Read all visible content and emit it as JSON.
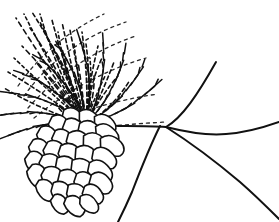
{
  "document": {
    "background_color": "#ffffff",
    "ink_color": "#111111"
  },
  "figure": {
    "caption": "Figure 1-5",
    "caption_cropped_at_top": true,
    "style": "black-and-white-pen-and-ink-line-drawing",
    "width": 279,
    "height": 222
  },
  "art": {
    "branch": {
      "name": "branch-lines",
      "stroke": "#111111",
      "stroke_width": 2.0,
      "node": [
        166,
        126
      ],
      "paths": [
        "M 126 126 C 140 126 154 126 166 127",
        "M 166 127 C 182 118 198 94 216 62",
        "M 166 127 C 186 132 206 136 226 134 C 244 133 262 128 279 122",
        "M 166 127 C 188 141 214 160 240 182 C 256 196 268 208 279 219",
        "M 160 126 C 152 142 142 166 132 192 C 126 206 122 214 118 222"
      ]
    },
    "cone": {
      "name": "pine-cone",
      "stroke": "#111111",
      "stroke_width": 1.6,
      "fill": "#ffffff",
      "axis_angle_deg": 48,
      "scale_count": 34,
      "scales": [
        [
          74,
          118,
          13,
          9,
          42
        ],
        [
          90,
          120,
          13,
          9,
          40
        ],
        [
          105,
          124,
          12,
          9,
          35
        ],
        [
          60,
          126,
          13,
          10,
          48
        ],
        [
          75,
          130,
          14,
          10,
          44
        ],
        [
          91,
          132,
          14,
          10,
          40
        ],
        [
          107,
          134,
          13,
          9,
          34
        ],
        [
          48,
          137,
          13,
          10,
          52
        ],
        [
          64,
          141,
          14,
          10,
          48
        ],
        [
          80,
          143,
          15,
          11,
          43
        ],
        [
          96,
          145,
          15,
          11,
          38
        ],
        [
          112,
          146,
          13,
          10,
          33
        ],
        [
          40,
          150,
          13,
          10,
          55
        ],
        [
          56,
          153,
          14,
          11,
          50
        ],
        [
          72,
          156,
          15,
          11,
          45
        ],
        [
          88,
          158,
          15,
          11,
          40
        ],
        [
          104,
          158,
          14,
          10,
          35
        ],
        [
          36,
          163,
          13,
          10,
          58
        ],
        [
          52,
          166,
          14,
          11,
          52
        ],
        [
          68,
          169,
          15,
          11,
          47
        ],
        [
          84,
          171,
          15,
          11,
          42
        ],
        [
          100,
          171,
          14,
          10,
          36
        ],
        [
          38,
          176,
          13,
          10,
          60
        ],
        [
          54,
          179,
          14,
          11,
          54
        ],
        [
          70,
          182,
          14,
          11,
          48
        ],
        [
          86,
          183,
          14,
          10,
          43
        ],
        [
          101,
          183,
          13,
          10,
          37
        ],
        [
          46,
          190,
          12,
          9,
          58
        ],
        [
          62,
          193,
          13,
          10,
          52
        ],
        [
          78,
          195,
          13,
          10,
          46
        ],
        [
          93,
          194,
          12,
          9,
          40
        ],
        [
          60,
          204,
          11,
          8,
          55
        ],
        [
          75,
          206,
          12,
          9,
          48
        ],
        [
          89,
          204,
          11,
          8,
          42
        ]
      ]
    },
    "needles": {
      "name": "needle-cluster",
      "stroke": "#111111",
      "style": "dashed-stippled-strokes",
      "origin": [
        86,
        124
      ],
      "stroke_width": 1.6,
      "dash_pattern": "4 3",
      "rays": [
        [
          86,
          124,
          16,
          18
        ],
        [
          86,
          124,
          24,
          14
        ],
        [
          86,
          124,
          32,
          12
        ],
        [
          86,
          124,
          40,
          14
        ],
        [
          86,
          124,
          30,
          28
        ],
        [
          86,
          124,
          40,
          22
        ],
        [
          86,
          124,
          52,
          20
        ],
        [
          86,
          124,
          62,
          22
        ],
        [
          86,
          124,
          46,
          36
        ],
        [
          86,
          124,
          58,
          32
        ],
        [
          86,
          124,
          70,
          30
        ],
        [
          86,
          124,
          82,
          32
        ],
        [
          86,
          124,
          62,
          48
        ],
        [
          86,
          124,
          74,
          44
        ],
        [
          86,
          124,
          86,
          44
        ],
        [
          86,
          124,
          98,
          46
        ],
        [
          86,
          124,
          78,
          62
        ],
        [
          86,
          124,
          90,
          58
        ],
        [
          86,
          124,
          102,
          58
        ],
        [
          86,
          124,
          114,
          62
        ],
        [
          86,
          124,
          94,
          76
        ],
        [
          86,
          124,
          106,
          74
        ],
        [
          86,
          124,
          118,
          76
        ],
        [
          86,
          124,
          130,
          80
        ],
        [
          86,
          124,
          36,
          62
        ],
        [
          86,
          124,
          44,
          76
        ],
        [
          86,
          124,
          50,
          90
        ],
        [
          86,
          124,
          56,
          104
        ],
        [
          86,
          124,
          22,
          46
        ],
        [
          86,
          124,
          14,
          58
        ],
        [
          86,
          124,
          8,
          72
        ],
        [
          86,
          124,
          4,
          88
        ]
      ],
      "fan_sweeps": [
        "M 24 96 C 48 62 84 36 126 22",
        "M 28 108 C 56 76 94 50 136 36",
        "M 34 118 C 66 92 104 70 146 58",
        "M 44 126 C 78 112 116 100 158 94",
        "M 56 132 C 90 128 128 124 166 122",
        "M 18 86 C 40 54 70 30 104 14"
      ]
    },
    "stalk": {
      "name": "cone-stalk",
      "paths": [
        "M 86 124 C 100 125 114 126 126 126"
      ],
      "stroke_width": 1.8
    }
  }
}
